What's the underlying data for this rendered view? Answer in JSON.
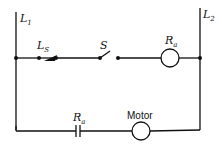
{
  "diagram": {
    "type": "ladder-diagram",
    "rails": {
      "left": {
        "label": "L",
        "sub": "1"
      },
      "right": {
        "label": "L",
        "sub": "2"
      }
    },
    "rungs": [
      {
        "elements": [
          {
            "kind": "limit-switch",
            "label": "L",
            "sub": "S"
          },
          {
            "kind": "switch",
            "label": "S"
          },
          {
            "kind": "relay-coil",
            "label": "R",
            "sub": "a"
          }
        ]
      },
      {
        "elements": [
          {
            "kind": "relay-contact-no",
            "label": "R",
            "sub": "a"
          },
          {
            "kind": "load",
            "label": "Motor"
          }
        ]
      }
    ]
  }
}
